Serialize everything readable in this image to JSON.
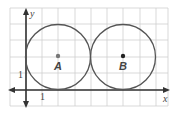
{
  "diagram": {
    "type": "coordinate-plane",
    "grid": {
      "unit_px": 16.25,
      "x_range": [
        -1,
        9
      ],
      "y_range": [
        -1,
        5
      ]
    },
    "axes": {
      "x_label": "x",
      "y_label": "y",
      "x_tick_label": "1",
      "y_tick_label": "1"
    },
    "circles": [
      {
        "name": "A",
        "label": "A",
        "center": [
          2,
          2
        ],
        "radius": 2
      },
      {
        "name": "B",
        "label": "B",
        "center": [
          6,
          2
        ],
        "radius": 2
      }
    ],
    "colors": {
      "grid": "#cfcfcf",
      "axis": "#333333",
      "circle": "#555555"
    }
  }
}
